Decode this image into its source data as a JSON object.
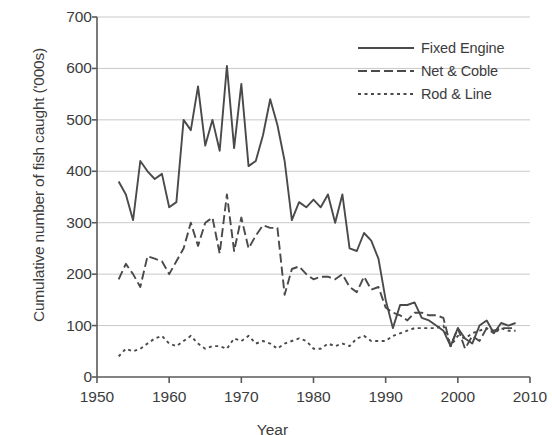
{
  "chart_data": {
    "type": "line",
    "title": "",
    "xlabel": "Year",
    "ylabel": "Cumulative number of fish caught ('000s)",
    "xlim": [
      1950,
      2010
    ],
    "ylim": [
      0,
      700
    ],
    "xticks": [
      1950,
      1960,
      1970,
      1980,
      1990,
      2000,
      2010
    ],
    "yticks": [
      0,
      100,
      200,
      300,
      400,
      500,
      600,
      700
    ],
    "grid": "horizontal",
    "legend_position": "top-right",
    "series": [
      {
        "name": "Fixed Engine",
        "style": "solid",
        "color": "#4a4a4a",
        "x": [
          1953,
          1954,
          1955,
          1956,
          1957,
          1958,
          1959,
          1960,
          1961,
          1962,
          1963,
          1964,
          1965,
          1966,
          1967,
          1968,
          1969,
          1970,
          1971,
          1972,
          1973,
          1974,
          1975,
          1976,
          1977,
          1978,
          1979,
          1980,
          1981,
          1982,
          1983,
          1984,
          1985,
          1986,
          1987,
          1988,
          1989,
          1990,
          1991,
          1992,
          1993,
          1994,
          1995,
          1996,
          1997,
          1998,
          1999,
          2000,
          2001,
          2002,
          2003,
          2004,
          2005,
          2006,
          2007,
          2008
        ],
        "values": [
          380,
          355,
          305,
          420,
          400,
          385,
          395,
          330,
          340,
          500,
          480,
          565,
          450,
          500,
          440,
          605,
          445,
          570,
          410,
          420,
          470,
          540,
          490,
          420,
          305,
          340,
          330,
          345,
          330,
          355,
          300,
          355,
          250,
          245,
          280,
          265,
          230,
          150,
          95,
          140,
          140,
          145,
          115,
          110,
          100,
          90,
          60,
          95,
          75,
          65,
          100,
          110,
          85,
          105,
          100,
          105
        ]
      },
      {
        "name": "Net & Coble",
        "style": "dashed",
        "color": "#4a4a4a",
        "x": [
          1953,
          1954,
          1955,
          1956,
          1957,
          1958,
          1959,
          1960,
          1961,
          1962,
          1963,
          1964,
          1965,
          1966,
          1967,
          1968,
          1969,
          1970,
          1971,
          1972,
          1973,
          1974,
          1975,
          1976,
          1977,
          1978,
          1979,
          1980,
          1981,
          1982,
          1983,
          1984,
          1985,
          1986,
          1987,
          1988,
          1989,
          1990,
          1991,
          1992,
          1993,
          1994,
          1995,
          1996,
          1997,
          1998,
          1999,
          2000,
          2001,
          2002,
          2003,
          2004,
          2005,
          2006,
          2007,
          2008
        ],
        "values": [
          190,
          220,
          200,
          175,
          235,
          230,
          225,
          200,
          225,
          250,
          300,
          255,
          300,
          310,
          240,
          355,
          245,
          310,
          250,
          275,
          295,
          290,
          290,
          160,
          210,
          215,
          200,
          190,
          195,
          195,
          190,
          200,
          175,
          165,
          195,
          170,
          175,
          135,
          125,
          120,
          110,
          125,
          125,
          120,
          120,
          115,
          60,
          95,
          55,
          80,
          70,
          95,
          90,
          95,
          95,
          95
        ]
      },
      {
        "name": "Rod & Line",
        "style": "dotted",
        "color": "#4a4a4a",
        "x": [
          1953,
          1954,
          1955,
          1956,
          1957,
          1958,
          1959,
          1960,
          1961,
          1962,
          1963,
          1964,
          1965,
          1966,
          1967,
          1968,
          1969,
          1970,
          1971,
          1972,
          1973,
          1974,
          1975,
          1976,
          1977,
          1978,
          1979,
          1980,
          1981,
          1982,
          1983,
          1984,
          1985,
          1986,
          1987,
          1988,
          1989,
          1990,
          1991,
          1992,
          1993,
          1994,
          1995,
          1996,
          1997,
          1998,
          1999,
          2000,
          2001,
          2002,
          2003,
          2004,
          2005,
          2006,
          2007,
          2008
        ],
        "values": [
          40,
          55,
          50,
          55,
          65,
          75,
          80,
          65,
          60,
          70,
          80,
          65,
          55,
          60,
          60,
          55,
          75,
          70,
          80,
          65,
          70,
          65,
          55,
          65,
          70,
          75,
          70,
          55,
          55,
          65,
          60,
          65,
          60,
          75,
          80,
          70,
          70,
          70,
          80,
          85,
          90,
          95,
          95,
          95,
          95,
          100,
          60,
          80,
          75,
          85,
          90,
          95,
          85,
          95,
          90,
          90
        ]
      }
    ]
  },
  "legend": {
    "items": [
      {
        "label": "Fixed Engine",
        "style": "solid"
      },
      {
        "label": "Net & Coble",
        "style": "dashed"
      },
      {
        "label": "Rod & Line",
        "style": "dotted"
      }
    ]
  },
  "axes": {
    "y_title": "Cumulative number of fish caught ('000s)",
    "x_title": "Year",
    "y_tick_labels": [
      "700",
      "600",
      "500",
      "400",
      "300",
      "200",
      "100",
      "0"
    ],
    "x_tick_labels": [
      "1950",
      "1960",
      "1970",
      "1980",
      "1990",
      "2000",
      "2010"
    ]
  },
  "colors": {
    "line": "#4a4a4a",
    "grid": "#c9c9c9",
    "axis": "#5a5a5a",
    "text": "#3c3c3c"
  }
}
